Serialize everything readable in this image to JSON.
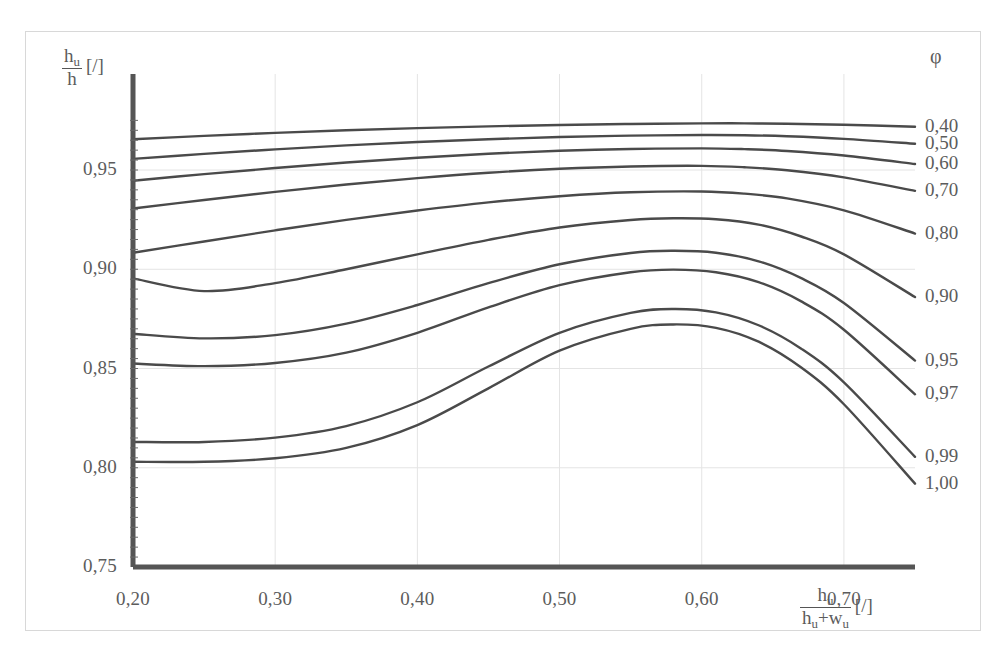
{
  "chart_data": {
    "type": "line",
    "title": "",
    "xlabel": "h_u / (h_u + w_u) [/]",
    "ylabel": "h_u / h [/]",
    "xlim": [
      0.2,
      0.75
    ],
    "ylim": [
      0.75,
      0.975
    ],
    "xticks": [
      0.2,
      0.3,
      0.4,
      0.5,
      0.6,
      0.7
    ],
    "xtick_labels": [
      "0,20",
      "0,30",
      "0,40",
      "0,50",
      "0,60",
      "0,70"
    ],
    "yticks": [
      0.75,
      0.8,
      0.85,
      0.9,
      0.95
    ],
    "ytick_labels": [
      "0,75",
      "0,80",
      "0,85",
      "0,90",
      "0,95"
    ],
    "grid": true,
    "legend_position": "right",
    "legend_title": "φ",
    "series": [
      {
        "name": "0,40",
        "label": "0,40",
        "x": [
          0.2,
          0.25,
          0.3,
          0.35,
          0.4,
          0.45,
          0.5,
          0.55,
          0.6,
          0.63,
          0.66,
          0.7,
          0.75
        ],
        "y": [
          0.9655,
          0.9672,
          0.9687,
          0.97,
          0.9711,
          0.972,
          0.9727,
          0.9732,
          0.9735,
          0.9735,
          0.9733,
          0.9728,
          0.9718
        ]
      },
      {
        "name": "0,50",
        "label": "0,50",
        "x": [
          0.2,
          0.25,
          0.3,
          0.35,
          0.4,
          0.45,
          0.5,
          0.55,
          0.6,
          0.63,
          0.66,
          0.7,
          0.75
        ],
        "y": [
          0.9556,
          0.9581,
          0.9604,
          0.9624,
          0.9641,
          0.9655,
          0.9666,
          0.9673,
          0.9676,
          0.9675,
          0.967,
          0.9657,
          0.9632
        ]
      },
      {
        "name": "0,60",
        "label": "0,60",
        "x": [
          0.2,
          0.25,
          0.3,
          0.35,
          0.4,
          0.45,
          0.5,
          0.55,
          0.6,
          0.63,
          0.66,
          0.7,
          0.75
        ],
        "y": [
          0.9446,
          0.9479,
          0.951,
          0.9538,
          0.9562,
          0.9582,
          0.9597,
          0.9606,
          0.9609,
          0.9605,
          0.9596,
          0.9573,
          0.953
        ]
      },
      {
        "name": "0,70",
        "label": "0,70",
        "x": [
          0.2,
          0.25,
          0.3,
          0.35,
          0.4,
          0.45,
          0.5,
          0.55,
          0.6,
          0.63,
          0.66,
          0.7,
          0.75
        ],
        "y": [
          0.9306,
          0.9349,
          0.939,
          0.9427,
          0.9459,
          0.9486,
          0.9506,
          0.9518,
          0.9521,
          0.9514,
          0.9499,
          0.9463,
          0.9395
        ]
      },
      {
        "name": "0,80",
        "label": "0,80",
        "x": [
          0.2,
          0.25,
          0.3,
          0.35,
          0.4,
          0.45,
          0.5,
          0.55,
          0.6,
          0.63,
          0.66,
          0.7,
          0.75
        ],
        "y": [
          0.9083,
          0.914,
          0.9196,
          0.9249,
          0.9296,
          0.9337,
          0.9368,
          0.9388,
          0.9392,
          0.9381,
          0.9357,
          0.9297,
          0.918
        ]
      },
      {
        "name": "0,90",
        "label": "0,90",
        "x": [
          0.2,
          0.25,
          0.3,
          0.35,
          0.4,
          0.45,
          0.5,
          0.55,
          0.58,
          0.61,
          0.64,
          0.67,
          0.7,
          0.75
        ],
        "y": [
          0.8954,
          0.889,
          0.893,
          0.9,
          0.9075,
          0.9148,
          0.921,
          0.9248,
          0.9257,
          0.9252,
          0.9225,
          0.9165,
          0.9075,
          0.886
        ]
      },
      {
        "name": "0,95",
        "label": "0,95",
        "x": [
          0.2,
          0.25,
          0.3,
          0.35,
          0.4,
          0.45,
          0.5,
          0.55,
          0.58,
          0.61,
          0.64,
          0.67,
          0.7,
          0.75
        ],
        "y": [
          0.8675,
          0.8652,
          0.8668,
          0.8726,
          0.882,
          0.893,
          0.9025,
          0.9082,
          0.9093,
          0.9083,
          0.904,
          0.8955,
          0.883,
          0.854
        ]
      },
      {
        "name": "0,97",
        "label": "0,97",
        "x": [
          0.2,
          0.25,
          0.3,
          0.35,
          0.4,
          0.45,
          0.5,
          0.55,
          0.58,
          0.61,
          0.64,
          0.67,
          0.7,
          0.75
        ],
        "y": [
          0.8525,
          0.8512,
          0.8528,
          0.858,
          0.868,
          0.8808,
          0.892,
          0.8985,
          0.8998,
          0.8985,
          0.8935,
          0.8838,
          0.8695,
          0.837
        ]
      },
      {
        "name": "0,99",
        "label": "0,99",
        "x": [
          0.2,
          0.25,
          0.3,
          0.35,
          0.4,
          0.45,
          0.5,
          0.55,
          0.58,
          0.61,
          0.64,
          0.67,
          0.7,
          0.75
        ],
        "y": [
          0.813,
          0.813,
          0.8152,
          0.821,
          0.833,
          0.851,
          0.868,
          0.878,
          0.88,
          0.8783,
          0.8718,
          0.86,
          0.843,
          0.8055
        ]
      },
      {
        "name": "1,00",
        "label": "1,00",
        "x": [
          0.2,
          0.25,
          0.3,
          0.35,
          0.4,
          0.45,
          0.5,
          0.55,
          0.58,
          0.61,
          0.64,
          0.67,
          0.7,
          0.75
        ],
        "y": [
          0.803,
          0.803,
          0.8048,
          0.81,
          0.8215,
          0.84,
          0.859,
          0.87,
          0.8722,
          0.8705,
          0.8635,
          0.8505,
          0.832,
          0.792
        ]
      }
    ]
  },
  "axes": {
    "y_title_num": "h",
    "y_title_num_sub": "u",
    "y_title_den": "h",
    "y_title_unit": "[/]",
    "x_title_num": "h",
    "x_title_num_sub": "u",
    "x_title_den_a": "h",
    "x_title_den_a_sub": "u",
    "x_title_den_plus": "+w",
    "x_title_den_b_sub": "u",
    "x_title_unit": "[/]"
  },
  "legend": {
    "symbol": "φ"
  },
  "colors": {
    "curve": "#4a4a4a",
    "axis": "#555555",
    "grid": "#e4e4e4",
    "text": "#5c5c5c",
    "frame": "#d8d8d8",
    "background": "#ffffff"
  }
}
